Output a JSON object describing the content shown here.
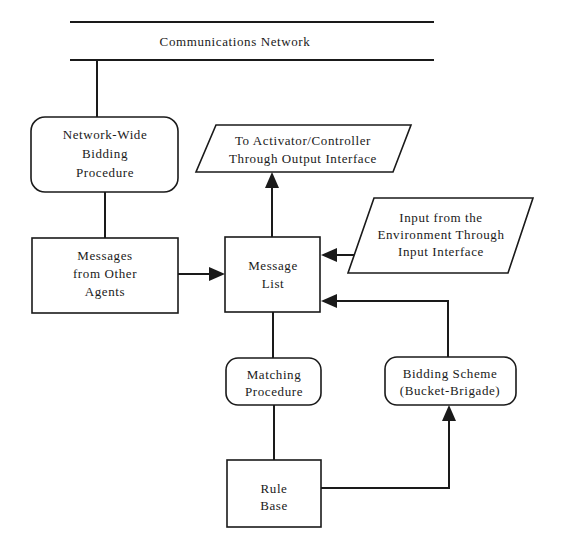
{
  "diagram": {
    "network": {
      "label": "Communications Network"
    },
    "nodes": {
      "network_bidding": {
        "shape": "rounded-rect",
        "lines": [
          "Network-Wide",
          "Bidding",
          "Procedure"
        ]
      },
      "output_interface": {
        "shape": "parallelogram",
        "lines": [
          "To Activator/Controller",
          "Through Output Interface"
        ]
      },
      "messages_other_agents": {
        "shape": "rect",
        "lines": [
          "Messages",
          "from Other",
          "Agents"
        ]
      },
      "message_list": {
        "shape": "rect",
        "lines": [
          "Message",
          "List"
        ]
      },
      "input_interface": {
        "shape": "parallelogram",
        "lines": [
          "Input from the",
          "Environment Through",
          "Input Interface"
        ]
      },
      "matching_procedure": {
        "shape": "rounded-rect",
        "lines": [
          "Matching",
          "Procedure"
        ]
      },
      "bidding_scheme": {
        "shape": "rounded-rect",
        "lines": [
          "Bidding Scheme",
          "(Bucket-Brigade)"
        ]
      },
      "rule_base": {
        "shape": "rect",
        "lines": [
          "Rule",
          "Base"
        ]
      }
    },
    "edges": [
      {
        "from": "network",
        "to": "network_bidding",
        "arrow": false
      },
      {
        "from": "network_bidding",
        "to": "messages_other_agents",
        "arrow": false
      },
      {
        "from": "messages_other_agents",
        "to": "message_list",
        "arrow": true
      },
      {
        "from": "message_list",
        "to": "output_interface",
        "arrow": true
      },
      {
        "from": "input_interface",
        "to": "message_list",
        "arrow": true
      },
      {
        "from": "bidding_scheme",
        "to": "message_list",
        "arrow": true
      },
      {
        "from": "message_list",
        "to": "matching_procedure",
        "arrow": false
      },
      {
        "from": "matching_procedure",
        "to": "rule_base",
        "arrow": false
      },
      {
        "from": "rule_base",
        "to": "bidding_scheme",
        "arrow": true
      }
    ]
  }
}
